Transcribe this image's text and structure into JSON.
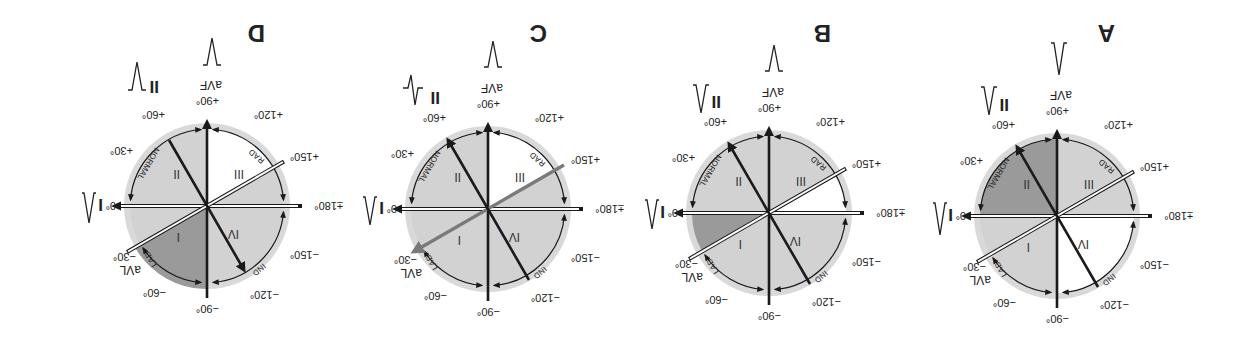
{
  "figure": {
    "orientation": "rotated-180",
    "colors": {
      "disc": "#d9d9d9",
      "light": "#d0d0d0",
      "dark": "#9a9a9a",
      "white": "#ffffff",
      "line": "#1a1a1a",
      "avl_arrow": "#7a7a7a"
    },
    "degree_labels": {
      "d0": "0°",
      "p30": "+30°",
      "p60": "+60°",
      "p90": "+90°",
      "p120": "+120°",
      "p150": "+150°",
      "p180": "±180°",
      "m30": "−30°",
      "m60": "−60°",
      "m90": "−90°",
      "m120": "−120°",
      "m150": "−150°"
    },
    "lead_labels": {
      "I": "I",
      "II": "II",
      "aVF": "aVF",
      "aVL": "aVL"
    },
    "region_labels": {
      "normal": "NORMAL",
      "lad": "LAD",
      "rad": "RAD",
      "ind": "IND"
    },
    "quadrant_labels": [
      "I",
      "II",
      "III",
      "IV"
    ],
    "panels": [
      {
        "letter": "A",
        "lead_I": "positive",
        "lead_II": "positive",
        "lead_aVF": "positive",
        "shaded_dark": "0° to +90° (normal, quadrant II)",
        "white": "quadrant IV (−90° to ±180° area)"
      },
      {
        "letter": "B",
        "lead_I": "positive",
        "lead_II": "positive",
        "lead_aVF": "negative",
        "shaded_dark": "0° to −30°",
        "white": "+150° to ±180°"
      },
      {
        "letter": "C",
        "lead_I": "positive",
        "lead_II": "biphasic",
        "lead_aVF": "negative",
        "shaded_dark": "none (axis at −30°, aVL arrow highlighted)",
        "white": "+90° to +150°"
      },
      {
        "letter": "D",
        "lead_I": "positive",
        "lead_II": "negative",
        "lead_aVF": "negative",
        "shaded_dark": "−30° to −90°",
        "white": "+90° to +150°"
      }
    ]
  }
}
